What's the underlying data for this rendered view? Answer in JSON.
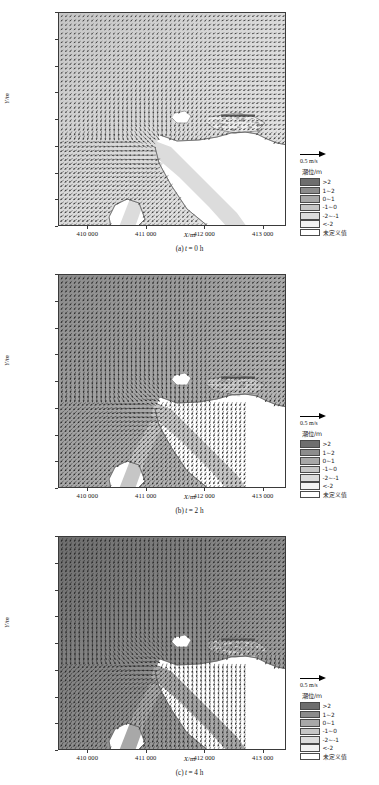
{
  "figure": {
    "axis": {
      "xlabel": "X/m",
      "ylabel": "Y/m",
      "xticks": [
        "410 000",
        "411 000",
        "412 000",
        "413 000"
      ],
      "yticks": [
        "4 444 000",
        "4 443 500",
        "4 443 000",
        "4 442 500",
        "4 442 000",
        "4 441 500",
        "4 441 000",
        "4 440 500",
        "4 440 000"
      ]
    },
    "legend": {
      "scale_label": "0.5 m/s",
      "title": "潮位/m",
      "entries": [
        {
          "label": ">2",
          "color": "#6e6e6e"
        },
        {
          "label": "1~2",
          "color": "#8c8c8c"
        },
        {
          "label": "0~1",
          "color": "#a8a8a8"
        },
        {
          "label": "-1~0",
          "color": "#c6c6c6"
        },
        {
          "label": "-2~-1",
          "color": "#dcdcdc"
        },
        {
          "label": "<-2",
          "color": "#f2f2f2"
        },
        {
          "label": "未定义值",
          "color": "#ffffff"
        }
      ]
    },
    "panels": [
      {
        "caption_prefix": "(a)",
        "caption_var": "t",
        "caption_value": "= 0 h"
      },
      {
        "caption_prefix": "(b)",
        "caption_var": "t",
        "caption_value": "= 2 h"
      },
      {
        "caption_prefix": "(c)",
        "caption_var": "t",
        "caption_value": "= 4 h"
      }
    ]
  },
  "chart_data": {
    "type": "scatter",
    "xlabel": "X/m",
    "ylabel": "Y/m",
    "xlim": [
      409500,
      413400
    ],
    "ylim": [
      4439900,
      4444200
    ],
    "xticks": [
      410000,
      411000,
      412000,
      413000
    ],
    "yticks": [
      4440000,
      4440500,
      4441000,
      4441500,
      4442000,
      4442500,
      4443000,
      4443500,
      4444000
    ],
    "grid": false,
    "legend_position": "right-outside",
    "vector_scale": {
      "reference_length_m_per_s": 0.5,
      "label": "0.5 m/s"
    },
    "colorbar": {
      "title": "潮位/m",
      "unit": "m",
      "bins": [
        ">2",
        "1~2",
        "0~1",
        "-1~0",
        "-2~-1",
        "<-2",
        "未定义值"
      ],
      "colors": [
        "#6e6e6e",
        "#8c8c8c",
        "#a8a8a8",
        "#c6c6c6",
        "#dcdcdc",
        "#f2f2f2",
        "#ffffff"
      ]
    },
    "series": [
      {
        "name": "(a) t = 0 h",
        "time_h": 0,
        "dominant_tide_bin": "-2~-1",
        "mean_tide_level_m": -1.4,
        "flow_direction_deg": 135,
        "description": "Low tide; light grey field, extensive undefined (dry) area south and east; current vectors point south-east across the open water."
      },
      {
        "name": "(b) t = 2 h",
        "time_h": 2,
        "dominant_tide_bin": "0~1",
        "mean_tide_level_m": 0.6,
        "flow_direction_deg": 120,
        "description": "Mid flood tide; mid-grey field covering most of the domain, channel inundated, vectors strengthen toward the south-east."
      },
      {
        "name": "(c) t = 4 h",
        "time_h": 4,
        "dominant_tide_bin": "1~2",
        "mean_tide_level_m": 1.7,
        "flow_direction_deg": 110,
        "description": "High tide; dark grey field throughout, tidal flats fully submerged, strongest vectors in the main channel."
      }
    ]
  }
}
